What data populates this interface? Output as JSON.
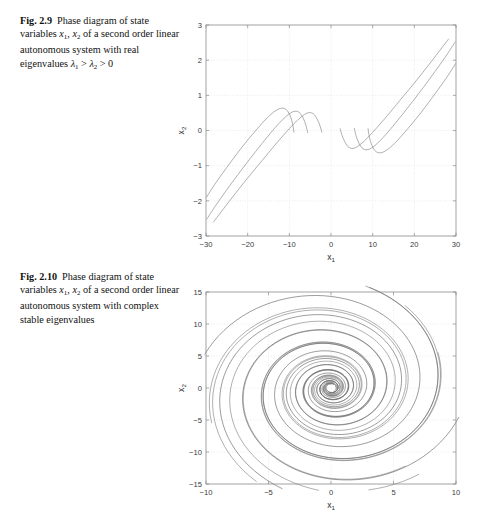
{
  "figures": [
    {
      "id": "fig-2-9",
      "caption": {
        "number": "Fig. 2.9",
        "line1_a": "Phase diagram of",
        "line2_a": "state variables ",
        "line2_v1": "x",
        "line2_v1s": "1",
        "line2_sep": ", ",
        "line2_v2": "x",
        "line2_v2s": "2",
        "line2_b": " of a",
        "line3": "second order linear",
        "line4": "autonomous system with real",
        "line5_a": "eigenvalues ",
        "line5_l1": "λ",
        "line5_l1s": "1",
        "line5_gt1": " > ",
        "line5_l2": "λ",
        "line5_l2s": "2",
        "line5_gt2": " > 0"
      },
      "chart_data": {
        "type": "line",
        "title": "",
        "xlabel": "x_1",
        "ylabel": "x_2",
        "xlim": [
          -30,
          30
        ],
        "ylim": [
          -3,
          3
        ],
        "xticks": [
          -30,
          -20,
          -10,
          0,
          10,
          20,
          30
        ],
        "yticks": [
          -3,
          -2,
          -1,
          0,
          1,
          2,
          3
        ],
        "xticklabels": [
          "−30",
          "−20",
          "−10",
          "0",
          "10",
          "20",
          "30"
        ],
        "yticklabels": [
          "−3",
          "−2",
          "−1",
          "0",
          "1",
          "2",
          "3"
        ],
        "grid": true,
        "legend": "none",
        "description": "Unstable node: six trajectories diverging from origin along dominant eigendirection",
        "series": [
          {
            "name": "traj-ur-1",
            "points": [
              [
                2.2,
                0.05
              ],
              [
                2.6,
                -0.12
              ],
              [
                3.3,
                -0.32
              ],
              [
                4.3,
                -0.48
              ],
              [
                5.6,
                -0.5
              ],
              [
                7.2,
                -0.38
              ],
              [
                9.0,
                -0.18
              ],
              [
                11.0,
                0.08
              ],
              [
                13.5,
                0.42
              ],
              [
                16.5,
                0.85
              ],
              [
                20.0,
                1.35
              ],
              [
                24.0,
                1.95
              ],
              [
                28.2,
                2.6
              ]
            ]
          },
          {
            "name": "traj-ur-2",
            "points": [
              [
                5.6,
                0.06
              ],
              [
                6.0,
                -0.14
              ],
              [
                6.7,
                -0.36
              ],
              [
                7.7,
                -0.52
              ],
              [
                9.0,
                -0.54
              ],
              [
                10.6,
                -0.42
              ],
              [
                12.5,
                -0.2
              ],
              [
                14.7,
                0.1
              ],
              [
                17.3,
                0.48
              ],
              [
                20.4,
                0.95
              ],
              [
                24.0,
                1.52
              ],
              [
                27.6,
                2.12
              ],
              [
                29.8,
                2.52
              ]
            ]
          },
          {
            "name": "traj-ur-3",
            "points": [
              [
                8.9,
                0.05
              ],
              [
                9.2,
                -0.18
              ],
              [
                9.8,
                -0.42
              ],
              [
                10.8,
                -0.6
              ],
              [
                12.1,
                -0.63
              ],
              [
                13.8,
                -0.52
              ],
              [
                15.8,
                -0.3
              ],
              [
                18.2,
                0.02
              ],
              [
                21.0,
                0.42
              ],
              [
                24.2,
                0.92
              ],
              [
                27.6,
                1.48
              ],
              [
                29.9,
                1.9
              ]
            ]
          },
          {
            "name": "traj-ll-1",
            "points": [
              [
                -2.2,
                -0.05
              ],
              [
                -2.6,
                0.12
              ],
              [
                -3.3,
                0.32
              ],
              [
                -4.3,
                0.48
              ],
              [
                -5.6,
                0.5
              ],
              [
                -7.2,
                0.38
              ],
              [
                -9.0,
                0.18
              ],
              [
                -11.0,
                -0.08
              ],
              [
                -13.5,
                -0.42
              ],
              [
                -16.5,
                -0.85
              ],
              [
                -20.0,
                -1.35
              ],
              [
                -24.0,
                -1.95
              ],
              [
                -28.2,
                -2.6
              ]
            ]
          },
          {
            "name": "traj-ll-2",
            "points": [
              [
                -5.6,
                -0.06
              ],
              [
                -6.0,
                0.14
              ],
              [
                -6.7,
                0.36
              ],
              [
                -7.7,
                0.52
              ],
              [
                -9.0,
                0.54
              ],
              [
                -10.6,
                0.42
              ],
              [
                -12.5,
                0.2
              ],
              [
                -14.7,
                -0.1
              ],
              [
                -17.3,
                -0.48
              ],
              [
                -20.4,
                -0.95
              ],
              [
                -24.0,
                -1.52
              ],
              [
                -27.6,
                -2.12
              ],
              [
                -29.8,
                -2.52
              ]
            ]
          },
          {
            "name": "traj-ll-3",
            "points": [
              [
                -8.9,
                -0.05
              ],
              [
                -9.2,
                0.18
              ],
              [
                -9.8,
                0.42
              ],
              [
                -10.8,
                0.6
              ],
              [
                -12.1,
                0.63
              ],
              [
                -13.8,
                0.52
              ],
              [
                -15.8,
                0.3
              ],
              [
                -18.2,
                -0.02
              ],
              [
                -21.0,
                -0.42
              ],
              [
                -24.2,
                -0.92
              ],
              [
                -27.6,
                -1.48
              ],
              [
                -29.9,
                -1.9
              ]
            ]
          }
        ]
      }
    },
    {
      "id": "fig-2-10",
      "caption": {
        "number": "Fig. 2.10",
        "line1_a": "Phase diagram of",
        "line2_a": "state variables ",
        "line2_v1": "x",
        "line2_v1s": "1",
        "line2_sep": ", ",
        "line2_v2": "x",
        "line2_v2s": "2",
        "line2_b": " of a",
        "line3": "second order linear",
        "line4": "autonomous system with",
        "line5_a": "complex stable eigenvalues"
      },
      "chart_data": {
        "type": "line",
        "title": "",
        "xlabel": "x_1",
        "ylabel": "x_2",
        "xlim": [
          -10,
          10
        ],
        "ylim": [
          -15,
          15
        ],
        "xticks": [
          -10,
          -5,
          0,
          5,
          10
        ],
        "yticks": [
          -15,
          -10,
          -5,
          0,
          5,
          10,
          15
        ],
        "xticklabels": [
          "−10",
          "−5",
          "0",
          "5",
          "10"
        ],
        "yticklabels": [
          "−15",
          "−10",
          "−5",
          "0",
          "5",
          "10",
          "15"
        ],
        "grid": true,
        "legend": "none",
        "description": "Stable focus (spiral sink): logarithmic spiral trajectories converging clockwise to the origin",
        "spiral": {
          "decay": 0.145,
          "xscale": 1.0,
          "yscale": 1.62,
          "turns": 3.6,
          "samples": 340,
          "starts": [
            {
              "r0": 11.2,
              "theta0": 2.55
            },
            {
              "r0": 10.4,
              "theta0": 2.05
            },
            {
              "r0": 9.9,
              "theta0": 1.55
            },
            {
              "r0": 10.6,
              "theta0": 0.35
            },
            {
              "r0": 10.9,
              "theta0": -0.25
            },
            {
              "r0": 10.2,
              "theta0": -0.85
            },
            {
              "r0": 10.6,
              "theta0": 3.45
            },
            {
              "r0": 10.1,
              "theta0": 4.1
            },
            {
              "r0": 10.8,
              "theta0": 4.75
            },
            {
              "r0": 11.4,
              "theta0": 5.55
            },
            {
              "r0": 9.2,
              "theta0": 1.0
            },
            {
              "r0": 9.6,
              "theta0": 6.0
            }
          ]
        }
      }
    }
  ]
}
